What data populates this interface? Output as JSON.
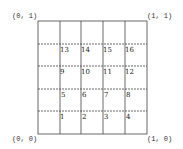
{
  "corners": {
    "top_left": "(0, 1)",
    "top_right": "(1, 1)",
    "bottom_left": "(0, 0)",
    "bottom_right": "(1, 0)"
  },
  "grid": {
    "columns": 5,
    "rows": 5,
    "cell_numbers": [
      [
        "13",
        "14",
        "15",
        "16"
      ],
      [
        "9",
        "10",
        "11",
        "12"
      ],
      [
        "5",
        "6",
        "7",
        "8"
      ],
      [
        "1",
        "2",
        "3",
        "4"
      ]
    ]
  },
  "colors": {
    "line": "#444444",
    "text": "#222222",
    "background": "#ffffff"
  }
}
